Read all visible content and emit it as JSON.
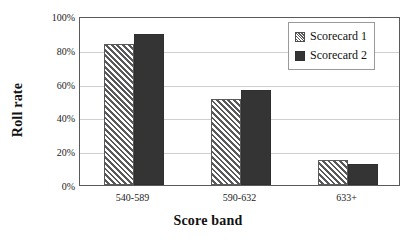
{
  "chart_data": {
    "type": "bar",
    "title": "",
    "xlabel": "Score band",
    "ylabel": "Roll rate",
    "categories": [
      "540-589",
      "590-632",
      "633+"
    ],
    "series": [
      {
        "name": "Scorecard 1",
        "values": [
          0.835,
          0.51,
          0.15
        ],
        "color": "#ffffff",
        "pattern": "diagonal-hatch"
      },
      {
        "name": "Scorecard 2",
        "values": [
          0.895,
          0.56,
          0.125
        ],
        "color": "#343434",
        "pattern": "solid"
      }
    ],
    "ylim": [
      0,
      1
    ],
    "y_ticks": [
      0,
      0.2,
      0.4,
      0.6,
      0.8,
      1.0
    ],
    "y_tick_labels": [
      "0%",
      "20%",
      "40%",
      "60%",
      "80%",
      "100%"
    ],
    "grid": "horizontal",
    "legend_position": "top-right"
  },
  "legend": {
    "entries": [
      {
        "label": "Scorecard 1"
      },
      {
        "label": "Scorecard 2"
      }
    ]
  },
  "axes": {
    "x_title": "Score band",
    "y_title": "Roll rate"
  }
}
